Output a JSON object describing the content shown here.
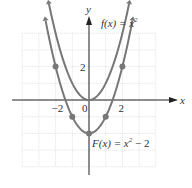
{
  "chart_data": {
    "type": "line",
    "title": "",
    "xlabel": "x",
    "ylabel": "y",
    "xlim": [
      -4,
      4
    ],
    "ylim": [
      -4,
      4
    ],
    "grid": true,
    "x_ticks": [
      {
        "value": -2,
        "label": "-2"
      },
      {
        "value": 0,
        "label": "0"
      },
      {
        "value": 2,
        "label": "2"
      }
    ],
    "y_ticks": [
      {
        "value": 2,
        "label": "2"
      }
    ],
    "series": [
      {
        "name": "f(x) = x²",
        "label_text": "f(x) = x",
        "exponent": "2",
        "suffix": "",
        "x": [
          -2.4,
          -2,
          -1,
          0,
          1,
          2,
          2.4
        ],
        "values": [
          5.76,
          4,
          1,
          0,
          1,
          4,
          5.76
        ],
        "marked_points": []
      },
      {
        "name": "F(x) = x² − 2",
        "label_text": "F(x) = x",
        "exponent": "2",
        "suffix": " − 2",
        "x": [
          -2.6,
          -2,
          -1,
          0,
          1,
          2,
          2.6
        ],
        "values": [
          4.76,
          2,
          -1,
          -2,
          -1,
          2,
          4.76
        ],
        "marked_points": [
          [
            -2,
            2
          ],
          [
            -1,
            -1
          ],
          [
            0,
            -2
          ],
          [
            1,
            -1
          ],
          [
            2,
            2
          ]
        ]
      }
    ],
    "colors": {
      "curve": "#777777",
      "grid": "#cccccc",
      "axis": "#222222"
    }
  }
}
